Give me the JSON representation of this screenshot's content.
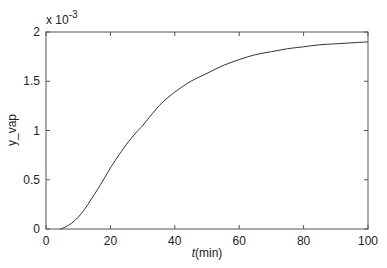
{
  "chart_data": {
    "type": "line",
    "title": "",
    "xlabel": "t(min)",
    "xlabel_italic_part": "t",
    "xlabel_unit_part": "(min)",
    "ylabel": "y_vap",
    "y_multiplier": "x 10",
    "y_multiplier_exponent": "-3",
    "xlim": [
      0,
      100
    ],
    "ylim": [
      0,
      0.002
    ],
    "xticks": [
      0,
      20,
      40,
      60,
      80,
      100
    ],
    "xtick_labels": [
      "0",
      "20",
      "40",
      "60",
      "80",
      "100"
    ],
    "yticks": [
      0,
      0.0005,
      0.001,
      0.0015,
      0.002
    ],
    "ytick_labels": [
      "0",
      "0.5",
      "1",
      "1.5",
      "2"
    ],
    "grid": false,
    "legend": null,
    "series": [
      {
        "name": "y_vap",
        "color": "#333333",
        "x": [
          4.3,
          6,
          8,
          10,
          12,
          14,
          16,
          18,
          20,
          22,
          25,
          28,
          30,
          33,
          36,
          40,
          45,
          50,
          55,
          60,
          65,
          70,
          75,
          80,
          85,
          90,
          95,
          100
        ],
        "y": [
          0.0,
          2e-05,
          6e-05,
          0.00012,
          0.0002,
          0.0003,
          0.0004,
          0.00051,
          0.00062,
          0.00072,
          0.00086,
          0.00098,
          0.00105,
          0.00117,
          0.00128,
          0.00139,
          0.0015,
          0.00158,
          0.00166,
          0.00172,
          0.00177,
          0.0018,
          0.00183,
          0.00185,
          0.00187,
          0.00188,
          0.00189,
          0.0019
        ]
      }
    ]
  }
}
